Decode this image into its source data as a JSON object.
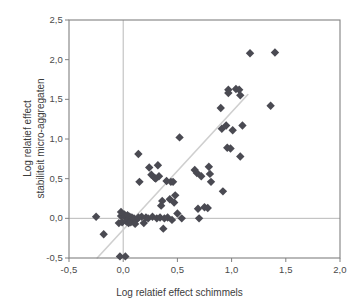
{
  "chart_data": {
    "type": "scatter",
    "title": "",
    "xlabel": "Log relatief effect schimmels",
    "ylabel_line1": "Log relatief effect",
    "ylabel_line2": "stabiliteit micro-aggregaten",
    "xlim": [
      -0.5,
      2.0
    ],
    "ylim": [
      -0.5,
      2.5
    ],
    "xticks": [
      -0.5,
      0.0,
      0.5,
      1.0,
      1.5,
      2.0
    ],
    "xtick_labels": [
      "-0,5",
      "0,0",
      "0,5",
      "1,0",
      "1,5",
      "2,0"
    ],
    "yticks": [
      -0.5,
      0.0,
      0.5,
      1.0,
      1.5,
      2.0,
      2.5
    ],
    "ytick_labels": [
      "-0,5",
      "0,0",
      "0,5",
      "1,0",
      "1,5",
      "2,0",
      "2,5"
    ],
    "grid": false,
    "legend": null,
    "marker": "diamond",
    "marker_size": 4.2,
    "marker_color": "#4a4a52",
    "reference_lines": [
      {
        "orientation": "horizontal",
        "value": 0.0,
        "color": "#b9b9b9"
      },
      {
        "orientation": "vertical",
        "value": 0.0,
        "color": "#b9b9b9"
      }
    ],
    "trend_line": {
      "x": [
        -0.24,
        1.15
      ],
      "y": [
        -0.5,
        1.56
      ],
      "color": "#cfcfcf"
    },
    "points": [
      [
        -0.25,
        0.02
      ],
      [
        -0.18,
        -0.2
      ],
      [
        -0.03,
        -0.48
      ],
      [
        0.02,
        -0.48
      ],
      [
        -0.02,
        0.08
      ],
      [
        -0.02,
        0.03
      ],
      [
        -0.04,
        -0.06
      ],
      [
        -0.01,
        -0.05
      ],
      [
        0.01,
        0.05
      ],
      [
        0.02,
        0.02
      ],
      [
        0.03,
        0.0
      ],
      [
        0.04,
        0.04
      ],
      [
        0.05,
        -0.01
      ],
      [
        0.06,
        0.02
      ],
      [
        0.03,
        -0.04
      ],
      [
        0.05,
        -0.06
      ],
      [
        0.07,
        -0.05
      ],
      [
        0.08,
        0.01
      ],
      [
        0.1,
        0.0
      ],
      [
        0.12,
        -0.02
      ],
      [
        0.11,
        -0.07
      ],
      [
        0.14,
        0.01
      ],
      [
        0.14,
        0.81
      ],
      [
        0.15,
        0.46
      ],
      [
        0.17,
        0.02
      ],
      [
        0.19,
        -0.06
      ],
      [
        0.21,
        0.01
      ],
      [
        0.23,
        0.0
      ],
      [
        0.24,
        0.64
      ],
      [
        0.26,
        0.55
      ],
      [
        0.27,
        0.02
      ],
      [
        0.29,
        0.51
      ],
      [
        0.3,
        0.5
      ],
      [
        0.31,
        0.0
      ],
      [
        0.32,
        0.67
      ],
      [
        0.33,
        0.53
      ],
      [
        0.34,
        0.01
      ],
      [
        0.35,
        0.16
      ],
      [
        0.36,
        0.22
      ],
      [
        0.37,
        -0.13
      ],
      [
        0.38,
        0.0
      ],
      [
        0.4,
        0.47
      ],
      [
        0.41,
        0.01
      ],
      [
        0.43,
        0.24
      ],
      [
        0.44,
        0.46
      ],
      [
        0.45,
        -0.02
      ],
      [
        0.46,
        0.46
      ],
      [
        0.47,
        0.2
      ],
      [
        0.48,
        0.29
      ],
      [
        0.5,
        0.06
      ],
      [
        0.52,
        1.02
      ],
      [
        0.54,
        0.0
      ],
      [
        0.66,
        0.61
      ],
      [
        0.68,
        0.57
      ],
      [
        0.69,
        0.12
      ],
      [
        0.7,
        0.0
      ],
      [
        0.72,
        0.53
      ],
      [
        0.75,
        0.14
      ],
      [
        0.78,
        0.13
      ],
      [
        0.79,
        0.65
      ],
      [
        0.8,
        0.56
      ],
      [
        0.81,
        0.46
      ],
      [
        0.9,
        1.39
      ],
      [
        0.91,
        1.13
      ],
      [
        0.92,
        0.34
      ],
      [
        0.95,
        1.17
      ],
      [
        0.96,
        0.89
      ],
      [
        0.97,
        1.62
      ],
      [
        0.97,
        1.58
      ],
      [
        0.99,
        0.88
      ],
      [
        1.01,
        1.11
      ],
      [
        1.04,
        1.63
      ],
      [
        1.07,
        1.62
      ],
      [
        1.08,
        1.55
      ],
      [
        1.08,
        0.78
      ],
      [
        1.1,
        1.17
      ],
      [
        1.17,
        2.08
      ],
      [
        1.36,
        1.42
      ],
      [
        1.4,
        2.09
      ]
    ]
  },
  "axis": {
    "frame_color": "#808080",
    "text_color": "#3c3c3c"
  }
}
